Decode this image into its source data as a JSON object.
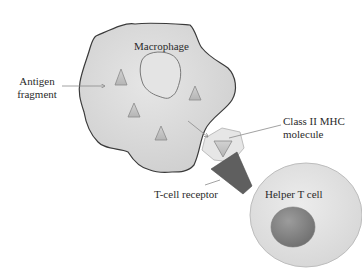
{
  "diagram": {
    "labels": {
      "macrophage": "Macrophage",
      "antigen_line1": "Antigen",
      "antigen_line2": "fragment",
      "mhc_line1": "Class II MHC",
      "mhc_line2": "molecule",
      "tcell_receptor": "T-cell receptor",
      "helper_tcell": "Helper T cell"
    },
    "colors": {
      "background": "#ffffff",
      "macrophage_fill": "#d9d9d9",
      "macrophage_outline": "#3a3a3a",
      "vacuole_fill": "#e4e4e4",
      "vacuole_outline": "#7a7a7a",
      "antigen_fill": "#c8c8c8",
      "antigen_outline": "#8a8a8a",
      "mhc_fill": "#e6e6e6",
      "mhc_outline": "#bdbdbd",
      "receptor_fill": "#5f5f5f",
      "helper_cell_fill": "#e2e2e2",
      "helper_cell_outline": "#bdbdbd",
      "nucleus_fill": "#8a8a8a",
      "arrow_color": "#8a8a8a",
      "label_color": "#2b2b2b"
    },
    "antigen_fragments_count": 6
  }
}
